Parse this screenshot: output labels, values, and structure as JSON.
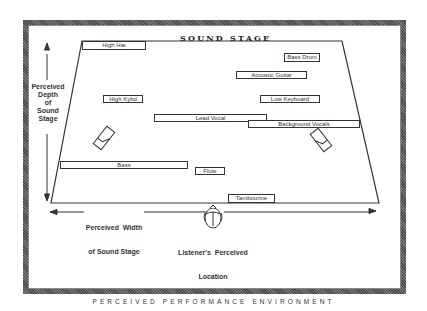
{
  "diagram": {
    "title": "SOUND STAGE",
    "caption": "PERCEIVED PERFORMANCE ENVIRONMENT",
    "colors": {
      "line": "#333333",
      "frame": "#4a4a4a",
      "background": "#ffffff"
    },
    "axes": {
      "depth_label": [
        "Perceived",
        "Depth",
        "of",
        "Sound",
        "Stage"
      ],
      "width_label_line1": "Perceived  Width",
      "width_label_line2": "of Sound Stage",
      "listener_line1": "Listener's  Perceived",
      "listener_line2": "Location"
    },
    "instruments": [
      {
        "label": "High Hat",
        "x": 82,
        "y": 41,
        "w": 64,
        "h": 9
      },
      {
        "label": "Bass Drum",
        "x": 284,
        "y": 53,
        "w": 36,
        "h": 9
      },
      {
        "label": "Acoustic Guitar",
        "x": 236,
        "y": 71,
        "w": 71,
        "h": 8
      },
      {
        "label": "High Kybd",
        "x": 103,
        "y": 95,
        "w": 40,
        "h": 8
      },
      {
        "label": "Low Keyboard",
        "x": 260,
        "y": 95,
        "w": 60,
        "h": 8
      },
      {
        "label": "Lead Vocal",
        "x": 154,
        "y": 114,
        "w": 113,
        "h": 8
      },
      {
        "label": "Background Vocals",
        "x": 248,
        "y": 120,
        "w": 112,
        "h": 8
      },
      {
        "label": "Bass",
        "x": 60,
        "y": 161,
        "w": 128,
        "h": 8
      },
      {
        "label": "Flute",
        "x": 195,
        "y": 167,
        "w": 30,
        "h": 8
      },
      {
        "label": "Tambourine",
        "x": 228,
        "y": 194,
        "w": 47,
        "h": 9
      }
    ],
    "speakers": [
      "left-speaker",
      "right-speaker"
    ],
    "stage_shape": {
      "top_left": [
        82,
        41
      ],
      "top_right": [
        342,
        41
      ],
      "bottom_right": [
        379,
        203
      ],
      "bottom_left": [
        51,
        203
      ]
    }
  }
}
